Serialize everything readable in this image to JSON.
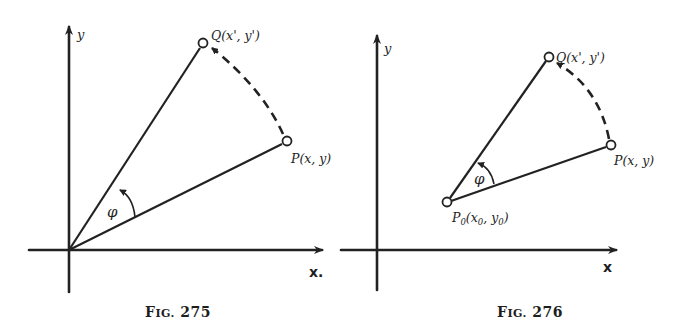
{
  "figures": [
    {
      "id": "fig275",
      "caption": {
        "prefix": "F",
        "small_caps": "IG.",
        "number": "275"
      },
      "axes": {
        "x_label": "x.",
        "y_label": "y"
      },
      "points": {
        "Q": {
          "label": "Q(x', y')"
        },
        "P": {
          "label": "P(x, y)"
        }
      },
      "angle_label": "φ",
      "description": "Rotation of point P about the origin by angle φ to point Q"
    },
    {
      "id": "fig276",
      "caption": {
        "prefix": "F",
        "small_caps": "IG.",
        "number": "276"
      },
      "axes": {
        "x_label": "x",
        "y_label": "y"
      },
      "points": {
        "Q": {
          "label": "Q(x', y')"
        },
        "P": {
          "label": "P(x, y)"
        },
        "P0": {
          "main": "P",
          "sub": "0",
          "open": "(x",
          "sub2": "0",
          "mid": ", y",
          "sub3": "0",
          "close": ")"
        }
      },
      "angle_label": "φ",
      "description": "Rotation of point P about point P0 by angle φ to point Q"
    }
  ],
  "colors": {
    "ink": "#222222",
    "background": "#ffffff"
  }
}
